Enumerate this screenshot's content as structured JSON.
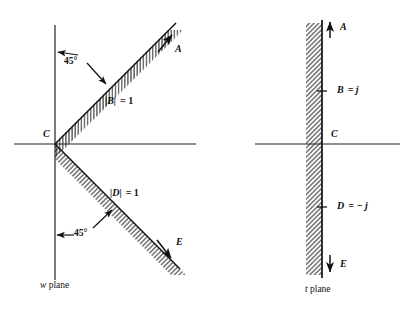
{
  "figure": {
    "title": "",
    "panels": [
      {
        "id": "w-plane",
        "caption_italic": "w",
        "caption_rest": " plane",
        "angle_top": "45°",
        "angle_bottom": "45°",
        "boundary_top_label": "|B|",
        "boundary_top_value": "= 1",
        "boundary_bottom_label": "|D|",
        "boundary_bottom_value": "= 1",
        "points": [
          {
            "name": "A",
            "label": "A"
          },
          {
            "name": "C",
            "label": "C"
          },
          {
            "name": "E",
            "label": "E"
          }
        ]
      },
      {
        "id": "t-plane",
        "caption_italic": "t",
        "caption_rest": " plane",
        "points": [
          {
            "name": "A",
            "label": "A"
          },
          {
            "name": "B",
            "label": "B",
            "value": "= j"
          },
          {
            "name": "C",
            "label": "C"
          },
          {
            "name": "D",
            "label": "D",
            "value": "= − j"
          },
          {
            "name": "E",
            "label": "E"
          }
        ]
      }
    ],
    "colors": {
      "ink": "#111111",
      "axis": "#222222",
      "hatch": "#333333",
      "background": "#ffffff"
    }
  }
}
